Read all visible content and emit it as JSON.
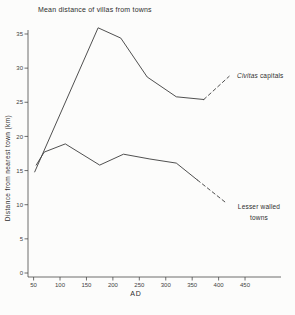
{
  "chart_data": {
    "type": "line",
    "title": "Mean distance of villas from towns",
    "xlabel": "AD",
    "ylabel": "Distance from nearest town (km)",
    "xlim": [
      50,
      480
    ],
    "ylim": [
      0,
      37
    ],
    "x_ticks": [
      50,
      100,
      150,
      200,
      250,
      300,
      350,
      400,
      450
    ],
    "y_ticks": [
      0,
      5,
      10,
      15,
      20,
      25,
      30,
      35
    ],
    "grid": false,
    "line_color": "#3c3c3c",
    "series": [
      {
        "name": "Civitas capitals",
        "label_italic": "Civitas",
        "label_rest": "capitals",
        "color": "#3c3c3c",
        "solid": [
          [
            52,
            14.8
          ],
          [
            172,
            35.9
          ],
          [
            215,
            34.4
          ],
          [
            265,
            28.7
          ],
          [
            320,
            25.8
          ],
          [
            372,
            25.4
          ]
        ],
        "dashed": [
          [
            372,
            25.4
          ],
          [
            420,
            28.8
          ]
        ]
      },
      {
        "name": "Lesser walled towns",
        "label_line1": "Lesser walled",
        "label_line2": "towns",
        "color": "#3c3c3c",
        "solid": [
          [
            55,
            15.8
          ],
          [
            70,
            17.7
          ],
          [
            110,
            18.9
          ],
          [
            175,
            15.8
          ],
          [
            220,
            17.4
          ],
          [
            270,
            16.7
          ],
          [
            320,
            16.1
          ],
          [
            360,
            13.6
          ]
        ],
        "dashed": [
          [
            360,
            13.6
          ],
          [
            412,
            10.4
          ]
        ]
      }
    ]
  }
}
